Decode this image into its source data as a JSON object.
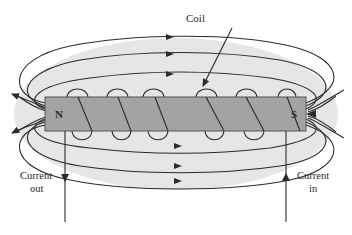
{
  "diagram": {
    "type": "electromagnet-solenoid-field",
    "labels": {
      "coil": "Coil",
      "north_pole": "N",
      "south_pole": "S",
      "current_out_line1": "Current",
      "current_out_line2": "out",
      "current_in_line1": "Current",
      "current_in_line2": "in"
    },
    "colors": {
      "background": "#ffffff",
      "field_region": "#e6e6e6",
      "bar_fill": "#a3a3a3",
      "bar_stroke": "#555555",
      "line": "#2b2b2b",
      "text": "#2a2a2a"
    },
    "components": {
      "bar": {
        "x": 45,
        "y": 97,
        "width": 261,
        "height": 34
      },
      "coil_turns": 5,
      "field_lines_above": 3,
      "field_lines_below": 3,
      "current_out_wire_x": 65,
      "current_in_wire_x": 286
    }
  }
}
